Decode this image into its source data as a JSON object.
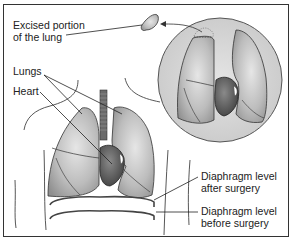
{
  "diagram": {
    "title": "",
    "labels": {
      "excised": [
        "Excised portion",
        "of the lung"
      ],
      "lungs": "Lungs",
      "heart": "Heart",
      "diaphragm_after": [
        "Diaphragm level",
        "after surgery"
      ],
      "diaphragm_before": [
        "Diaphragm level",
        "before surgery"
      ]
    },
    "colors": {
      "lung_fill": "#b5b5b5",
      "lung_highlight": "#e2e2e2",
      "heart_fill": "#5a5a5a",
      "inset_fill": "#d4d4d4",
      "line": "#333333",
      "diaphragm": "#444444"
    }
  }
}
